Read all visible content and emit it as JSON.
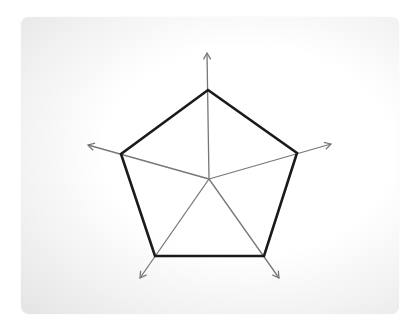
{
  "diagram": {
    "type": "radar-pentagon",
    "center": [
      209,
      179
    ],
    "axes": [
      {
        "name": "axis-top",
        "vertex": [
          208,
          90
        ],
        "tip": [
          207,
          53
        ]
      },
      {
        "name": "axis-right",
        "vertex": [
          297,
          153
        ],
        "tip": [
          331,
          144
        ]
      },
      {
        "name": "axis-bottom-right",
        "vertex": [
          264,
          256
        ],
        "tip": [
          279,
          278
        ]
      },
      {
        "name": "axis-bottom-left",
        "vertex": [
          155,
          256
        ],
        "tip": [
          140,
          278
        ]
      },
      {
        "name": "axis-left",
        "vertex": [
          121,
          154
        ],
        "tip": [
          88,
          145
        ]
      }
    ],
    "colors": {
      "polygon": "#1a1a1a",
      "axis": "#777777",
      "card_edge": "#e4e4e4"
    }
  }
}
